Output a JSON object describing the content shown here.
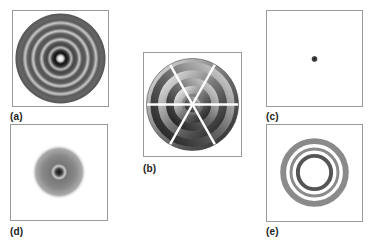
{
  "figure": {
    "panels": [
      {
        "id": "a",
        "label": "(a)",
        "content": "concentric ring pattern with bright center"
      },
      {
        "id": "b",
        "label": "(b)",
        "content": "segmented concentric rings with phase wedges"
      },
      {
        "id": "c",
        "label": "(c)",
        "content": "single central dot"
      },
      {
        "id": "d",
        "label": "(d)",
        "content": "diffuse radial blob with dark core"
      },
      {
        "id": "e",
        "label": "(e)",
        "content": "three concentric rings with empty center"
      }
    ],
    "colors": {
      "frame": "#9a9a9a",
      "dark": "#333333",
      "mid": "#777777",
      "light": "#cccccc"
    }
  }
}
